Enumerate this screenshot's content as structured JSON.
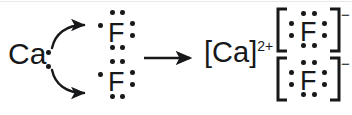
{
  "diagram": {
    "type": "lewis-dot-reaction",
    "background_color": "#ffffff",
    "ink_color": "#17181a",
    "reactants": {
      "metal": {
        "symbol": "Ca",
        "valence_electrons": 2,
        "dot_groups": [
          {
            "position": "right",
            "count": 2
          }
        ]
      },
      "nonmetals": [
        {
          "symbol": "F",
          "position": "top",
          "valence_electrons": 7,
          "dot_groups": [
            {
              "position": "top",
              "count": 2
            },
            {
              "position": "right",
              "count": 2
            },
            {
              "position": "bottom",
              "count": 2
            },
            {
              "position": "left",
              "count": 1
            }
          ]
        },
        {
          "symbol": "F",
          "position": "bottom",
          "valence_electrons": 7,
          "dot_groups": [
            {
              "position": "top",
              "count": 2
            },
            {
              "position": "right",
              "count": 2
            },
            {
              "position": "bottom",
              "count": 2
            },
            {
              "position": "left",
              "count": 1
            }
          ]
        }
      ]
    },
    "electron_transfer_arrows": {
      "count": 2,
      "style": "curved",
      "from": "Ca",
      "to": [
        "F-top",
        "F-bottom"
      ]
    },
    "reaction_arrow": {
      "style": "straight-right",
      "label": ""
    },
    "products": {
      "cation": {
        "symbol": "Ca",
        "bracket_open": "[",
        "bracket_close": "]",
        "charge": "2+",
        "dot_groups": []
      },
      "anions": [
        {
          "symbol": "F",
          "position": "top",
          "bracket_open": "[",
          "bracket_close": "]",
          "charge": "−",
          "valence_electrons": 8,
          "dot_groups": [
            {
              "position": "top",
              "count": 2
            },
            {
              "position": "right",
              "count": 2
            },
            {
              "position": "bottom",
              "count": 2
            },
            {
              "position": "left",
              "count": 2
            }
          ]
        },
        {
          "symbol": "F",
          "position": "bottom",
          "bracket_open": "[",
          "bracket_close": "]",
          "charge": "−",
          "valence_electrons": 8,
          "dot_groups": [
            {
              "position": "top",
              "count": 2
            },
            {
              "position": "right",
              "count": 2
            },
            {
              "position": "bottom",
              "count": 2
            },
            {
              "position": "left",
              "count": 2
            }
          ]
        }
      ]
    },
    "labels": {
      "ca": "Ca",
      "f": "F",
      "charge_cation": "2+",
      "charge_anion": "−",
      "bracket_left": "[",
      "bracket_right": "]"
    }
  }
}
